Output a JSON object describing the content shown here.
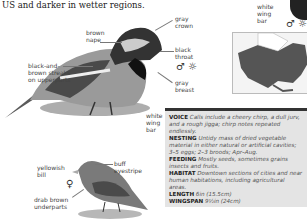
{
  "intro_text": "US and darker in wetter regions.",
  "male": {
    "labels": {
      "brown_nape": "brown\nnape",
      "gray_crown": "gray\ncrown",
      "black_throat": "black\nthroat",
      "gray_breast": "gray\nbreast",
      "streaks": "black-and-\nbrown streaks\non upperparts",
      "white_wing_bar_top": "white\nwing\nbar",
      "white_wing_bar": "white\nwing\nbar"
    },
    "symbols": {
      "sex": "♂",
      "season": "☼"
    }
  },
  "female": {
    "labels": {
      "yellowish_bill": "yellowish\nbill",
      "buff_eyestripe": "buff\neyestripe",
      "drab_underparts": "drab brown\nunderparts"
    },
    "symbols": {
      "sex": "♀"
    }
  },
  "info": [
    {
      "key": "VOICE",
      "value": "Calls include a cheery chirp, a dull jurv, and a rough jiggа; chirp notes repeated endlessly."
    },
    {
      "key": "NESTING",
      "value": "Untidy mass of dried vegetable material in either natural or artificial cavities; 3–5 eggs; 2–3 broods; Apr–Aug."
    },
    {
      "key": "FEEDING",
      "value": "Mostly seeds, sometimes grains insects and fruits."
    },
    {
      "key": "HABITAT",
      "value": "Downtown sections of cities and near human habitations, including agricultural areas."
    },
    {
      "key": "LENGTH",
      "value": "6in (15.5cm)"
    },
    {
      "key": "WINGSPAN",
      "value": "9½in (24cm)"
    }
  ],
  "colors": {
    "box_bg": "#e4e4e4",
    "box_rule": "#333333",
    "range": "#555555"
  }
}
